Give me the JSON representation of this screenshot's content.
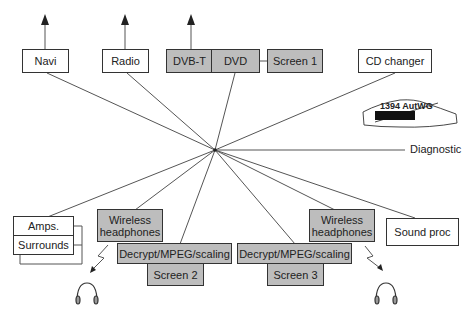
{
  "diagram": {
    "hub_name": "1394 network hub",
    "top_devices": [
      {
        "id": "navi",
        "label": "Navi"
      },
      {
        "id": "radio",
        "label": "Radio"
      },
      {
        "id": "dvbt",
        "label": "DVB-T"
      },
      {
        "id": "dvd",
        "label": "DVD"
      },
      {
        "id": "screen1",
        "label": "Screen 1"
      },
      {
        "id": "cd",
        "label": "CD changer"
      }
    ],
    "diagnostic_label": "Diagnostic",
    "logo": {
      "title": "1394 AutWG",
      "subtitle": "THE AUTOMOTIVE WORKING GROUP"
    },
    "bottom_devices": [
      {
        "id": "amps",
        "label": "Amps."
      },
      {
        "id": "surrounds",
        "label": "Surrounds"
      },
      {
        "id": "wh1",
        "label": "Wireless headphones"
      },
      {
        "id": "dec1",
        "label": "Decrypt/MPEG/scaling"
      },
      {
        "id": "screen2",
        "label": "Screen 2"
      },
      {
        "id": "dec2",
        "label": "Decrypt/MPEG/scaling"
      },
      {
        "id": "screen3",
        "label": "Screen 3"
      },
      {
        "id": "wh2",
        "label": "Wireless headphones"
      },
      {
        "id": "soundproc",
        "label": "Sound proc"
      }
    ],
    "colors": {
      "shaded_box": "#bdbdbd",
      "line": "#555555"
    }
  }
}
